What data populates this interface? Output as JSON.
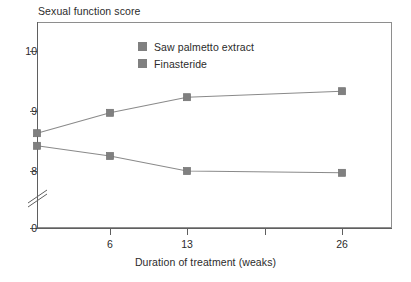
{
  "chart_data": {
    "type": "line",
    "title": "",
    "ylabel": "Sexual function score",
    "xlabel": "Duration of treatment (weaks)",
    "categories": [
      "0",
      "6",
      "13",
      "26"
    ],
    "x_tick_labels": [
      "6",
      "13",
      "26"
    ],
    "y_tick_labels": [
      "10",
      "9",
      "8",
      "0"
    ],
    "ylim": [
      7.6,
      10.3
    ],
    "y_axis_break": true,
    "grid": false,
    "legend_position": "inside-top-center",
    "series": [
      {
        "name": "Saw palmetto extract",
        "color": "#808080",
        "values": [
          8.63,
          8.97,
          9.23,
          9.33
        ]
      },
      {
        "name": "Finasteride",
        "color": "#808080",
        "values": [
          8.42,
          8.25,
          8.0,
          7.97
        ]
      }
    ]
  },
  "legend": {
    "items": [
      {
        "label": "Saw palmetto extract",
        "color": "#808080"
      },
      {
        "label": "Finasteride",
        "color": "#808080"
      }
    ]
  },
  "axes": {
    "y_caption": "Sexual function score",
    "x_caption": "Duration of treatment (weaks)",
    "y_ticks": [
      {
        "label": "10",
        "y": 51
      },
      {
        "label": "9",
        "y": 111
      },
      {
        "label": "8",
        "y": 171
      },
      {
        "label": "0",
        "y": 228
      }
    ],
    "x_ticks": [
      {
        "label": "6",
        "x": 110
      },
      {
        "label": "13",
        "x": 187
      },
      {
        "label": "",
        "x": 265
      },
      {
        "label": "26",
        "x": 342
      }
    ]
  },
  "colors": {
    "marker": "#808080",
    "line": "#8a8a8a",
    "axis": "#5f5f5f",
    "frame": "#8e8e8e",
    "text": "#2b2b2b",
    "background": "#ffffff"
  }
}
